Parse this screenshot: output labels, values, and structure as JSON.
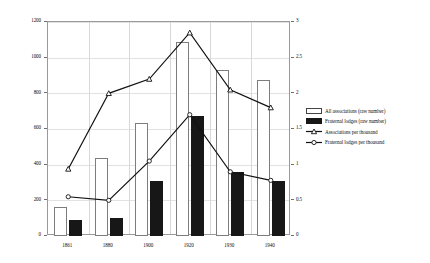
{
  "chart_data": {
    "type": "bar",
    "title": "",
    "xlabel": "",
    "ylabel": "",
    "categories": [
      "1861",
      "1880",
      "1900",
      "1920",
      "1930",
      "1940"
    ],
    "left_axis": {
      "label": "",
      "ylim": [
        0,
        1200
      ],
      "ticks": [
        "0",
        "200",
        "400",
        "600",
        "800",
        "1000",
        "1200"
      ],
      "tick_values": [
        0,
        200,
        400,
        600,
        800,
        1000,
        1200
      ]
    },
    "right_axis": {
      "label": "",
      "ylim": [
        0,
        3
      ],
      "ticks": [
        "0",
        "0.5",
        "1",
        "1.5",
        "2",
        "2.5",
        "3"
      ],
      "tick_values": [
        0,
        0.5,
        1,
        1.5,
        2,
        2.5,
        3
      ]
    },
    "grid": true,
    "legend_position": "right",
    "series": [
      {
        "name": "All associations (raw number)",
        "type": "bar",
        "axis": "left",
        "style": "open",
        "color": "#ffffff",
        "edge_color": "#7d7d7d",
        "values": [
          165,
          440,
          635,
          1090,
          930,
          875
        ]
      },
      {
        "name": "Fraternal lodges (raw number)",
        "type": "bar",
        "axis": "left",
        "style": "solid",
        "color": "#171717",
        "values": [
          90,
          100,
          310,
          675,
          360,
          310
        ]
      },
      {
        "name": "Associations per thousand",
        "type": "line",
        "axis": "right",
        "marker": "triangle",
        "color": "#111111",
        "values": [
          0.94,
          2.0,
          2.2,
          2.85,
          2.05,
          1.8
        ]
      },
      {
        "name": "Fraternal lodges per thousand",
        "type": "line",
        "axis": "right",
        "marker": "circle",
        "color": "#111111",
        "values": [
          0.55,
          0.5,
          1.05,
          1.7,
          0.9,
          0.78
        ]
      }
    ]
  },
  "legend": {
    "items": [
      {
        "label": "All associations (raw number)"
      },
      {
        "label": "Fraternal lodges (raw number)"
      },
      {
        "label": "Associations per thousand"
      },
      {
        "label": "Fraternal lodges per thousand"
      }
    ]
  }
}
